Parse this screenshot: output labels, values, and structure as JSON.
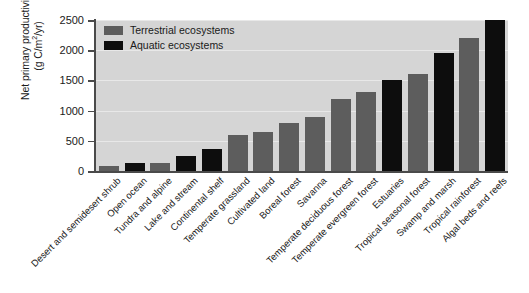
{
  "chart_data": {
    "type": "bar",
    "title": "",
    "xlabel": "",
    "ylabel_line1": "Net primary productivity",
    "ylabel_line2": "(g C/m2/yr)",
    "ylabel_units_base": "(g C/m",
    "ylabel_units_exp": "2",
    "ylabel_units_tail": "/yr)",
    "ylim": [
      0,
      2500
    ],
    "yticks": [
      0,
      500,
      1000,
      1500,
      2000,
      2500
    ],
    "ytick_labels": [
      "0",
      "500",
      "1000",
      "1500",
      "2000",
      "2500"
    ],
    "grid": true,
    "grid_axis": "y",
    "legend_position": "upper-left-inside",
    "categories": [
      "Desert and semidesert shrub",
      "Open ocean",
      "Tundra and alpine",
      "Lake and stream",
      "Continental shelf",
      "Temperate grassland",
      "Cultivated land",
      "Boreal forest",
      "Savanna",
      "Temperate deciduous forest",
      "Temperate evergreen forest",
      "Estuaries",
      "Tropical seasonal forest",
      "Swamp and marsh",
      "Tropical rainforest",
      "Algal beds and reefs"
    ],
    "values": [
      90,
      125,
      140,
      250,
      360,
      600,
      650,
      800,
      900,
      1200,
      1300,
      1500,
      1600,
      1950,
      2200,
      2500
    ],
    "groups": [
      "terrestrial",
      "aquatic",
      "terrestrial",
      "aquatic",
      "aquatic",
      "terrestrial",
      "terrestrial",
      "terrestrial",
      "terrestrial",
      "terrestrial",
      "terrestrial",
      "aquatic",
      "terrestrial",
      "aquatic",
      "terrestrial",
      "aquatic"
    ],
    "series": [
      {
        "name": "Terrestrial ecosystems",
        "color": "#5d5d5d",
        "points": [
          {
            "category": "Desert and semidesert shrub",
            "value": 90
          },
          {
            "category": "Tundra and alpine",
            "value": 140
          },
          {
            "category": "Temperate grassland",
            "value": 600
          },
          {
            "category": "Cultivated land",
            "value": 650
          },
          {
            "category": "Boreal forest",
            "value": 800
          },
          {
            "category": "Savanna",
            "value": 900
          },
          {
            "category": "Temperate deciduous forest",
            "value": 1200
          },
          {
            "category": "Temperate evergreen forest",
            "value": 1300
          },
          {
            "category": "Tropical seasonal forest",
            "value": 1600
          },
          {
            "category": "Tropical rainforest",
            "value": 2200
          }
        ]
      },
      {
        "name": "Aquatic ecosystems",
        "color": "#0d0d0d",
        "points": [
          {
            "category": "Open ocean",
            "value": 125
          },
          {
            "category": "Lake and stream",
            "value": 250
          },
          {
            "category": "Continental shelf",
            "value": 360
          },
          {
            "category": "Estuaries",
            "value": 1500
          },
          {
            "category": "Swamp and marsh",
            "value": 1950
          },
          {
            "category": "Algal beds and reefs",
            "value": 2500
          }
        ]
      }
    ],
    "legend": [
      {
        "label": "Terrestrial ecosystems",
        "color": "#5d5d5d",
        "key": "terrestrial"
      },
      {
        "label": "Aquatic ecosystems",
        "color": "#0d0d0d",
        "key": "aquatic"
      }
    ],
    "colors": {
      "terrestrial": "#5d5d5d",
      "aquatic": "#0d0d0d",
      "plot_background": "#d5d5d5",
      "gridline": "#e8e8e8",
      "axis": "#4a4a4a",
      "text": "#1a1a1a",
      "figure_background": "#ffffff"
    }
  }
}
